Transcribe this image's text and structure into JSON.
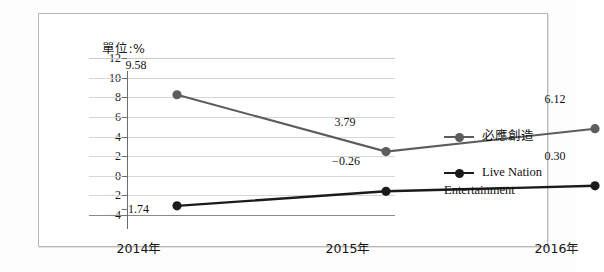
{
  "chart_data": {
    "type": "line",
    "title": "",
    "unit_label": "單位:%",
    "xlabel": "",
    "ylabel": "",
    "categories": [
      "2014年",
      "2015年",
      "2016年"
    ],
    "ylim": [
      -4,
      12
    ],
    "yticks": [
      12,
      10,
      8,
      6,
      4,
      2,
      0,
      -2,
      -4
    ],
    "ytick_labels": [
      "12",
      "10",
      "8",
      "6",
      "4",
      "2",
      "0",
      "-2",
      "-4"
    ],
    "grid": true,
    "legend_position": "right",
    "series": [
      {
        "name": "必應創造",
        "color": "#5d5d5d",
        "marker": "circle",
        "values": [
          9.58,
          3.79,
          6.12
        ],
        "data_labels": [
          "9.58",
          "3.79",
          "6.12"
        ]
      },
      {
        "name": "Live Nation Entertainment",
        "color": "#1b1b1b",
        "marker": "circle",
        "values": [
          -1.74,
          -0.26,
          0.3
        ],
        "data_labels": [
          "-1.74",
          "-0.26",
          "0.30"
        ]
      }
    ],
    "colors": {
      "grid": "#d6d6d6",
      "axis": "#6e6e6e",
      "frame": "#b9b9b9",
      "text": "#141414"
    }
  }
}
